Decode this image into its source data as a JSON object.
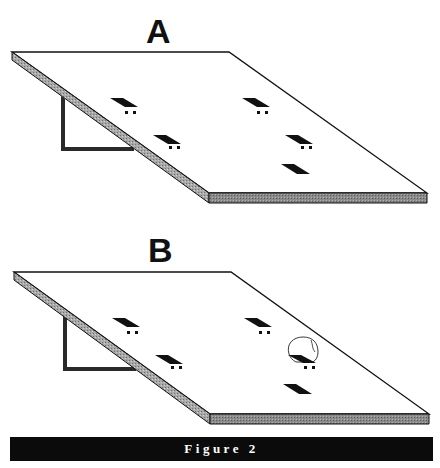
{
  "figure": {
    "caption": "Figure 2",
    "colors": {
      "background": "#ffffff",
      "outline": "#111111",
      "edge_shade": "#9a9a9a",
      "front_edge_shade": "#7a7a7a",
      "mark": "#111111",
      "caption_bar": "#0b0b0b",
      "caption_text": "#ffffff"
    },
    "panels": [
      {
        "label": "A",
        "description": "Tilted board on bracket with five dark rectangular marks; four have two small dots beneath",
        "marks": 5,
        "marks_with_dots": 4,
        "highlighted_mark": null
      },
      {
        "label": "B",
        "description": "Same tilted board; one mark (right, middle row) has a dome/hood outline drawn over it",
        "marks": 5,
        "marks_with_dots": 4,
        "highlighted_mark": "right-middle"
      }
    ]
  }
}
